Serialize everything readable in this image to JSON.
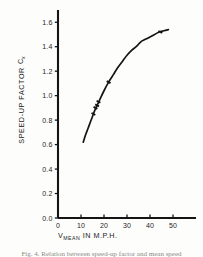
{
  "figure": {
    "background_color": "#fdfdfb",
    "ink_color": "#141414"
  },
  "axis_titles": {
    "y_main": "SPEED-UP FACTOR",
    "y_symbol": "C",
    "y_symbol_sub": "x",
    "x_symbol": "V",
    "x_symbol_sub": "MEAN",
    "x_rest": "IN M.P.H."
  },
  "caption": {
    "text": "Fig. 4. Relation between speed-up factor and mean speed"
  },
  "chart_data": {
    "type": "line",
    "title": "",
    "subtitle": "",
    "xlabel": "V MEAN IN M.P.H.",
    "ylabel": "SPEED-UP FACTOR Cx",
    "xlim": [
      0,
      60
    ],
    "ylim": [
      0.0,
      1.7
    ],
    "xticks": [
      0,
      10,
      20,
      30,
      40,
      50
    ],
    "xtick_labels": [
      "0",
      "10",
      "20",
      "30",
      "40",
      "50"
    ],
    "yticks": [
      0.0,
      0.2,
      0.4,
      0.6,
      0.8,
      1.0,
      1.2,
      1.4,
      1.6
    ],
    "ytick_labels": [
      "0.0",
      "0.2",
      "0.4",
      "0.6",
      "0.8",
      "1.0",
      "1.2",
      "1.4",
      "1.6"
    ],
    "grid": false,
    "legend": false,
    "legend_position": "none",
    "series": [
      {
        "name": "Speed-up factor curve",
        "x": [
          11.0,
          12.0,
          13.0,
          14.0,
          15.0,
          16.0,
          17.0,
          18.0,
          20.0,
          22.0,
          24.0,
          26.0,
          28.0,
          30.0,
          32.0,
          34.0,
          36.0,
          38.0,
          40.0,
          42.0,
          44.0,
          46.0,
          48.0
        ],
        "y": [
          0.62,
          0.68,
          0.73,
          0.78,
          0.83,
          0.88,
          0.92,
          0.96,
          1.04,
          1.11,
          1.17,
          1.23,
          1.28,
          1.33,
          1.37,
          1.4,
          1.44,
          1.46,
          1.48,
          1.5,
          1.52,
          1.53,
          1.54
        ]
      }
    ],
    "data_points": {
      "name": "measured points",
      "x": [
        15.4,
        16.3,
        17.0,
        17.6,
        22.0,
        44.5
      ],
      "y": [
        0.85,
        0.9,
        0.92,
        0.95,
        1.11,
        1.52
      ]
    }
  }
}
